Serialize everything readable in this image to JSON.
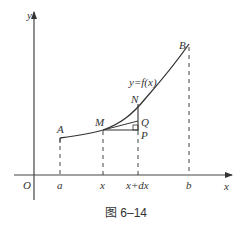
{
  "figure": {
    "caption": "图 6–14",
    "curve_label": "y=f(x)",
    "axes": {
      "x_label": "x",
      "y_label": "y",
      "origin_label": "O"
    },
    "x_ticks": [
      "a",
      "x",
      "x+dx",
      "b"
    ],
    "points": {
      "A": "A",
      "B": "B",
      "M": "M",
      "N": "N",
      "Q": "Q",
      "P": "P"
    }
  }
}
